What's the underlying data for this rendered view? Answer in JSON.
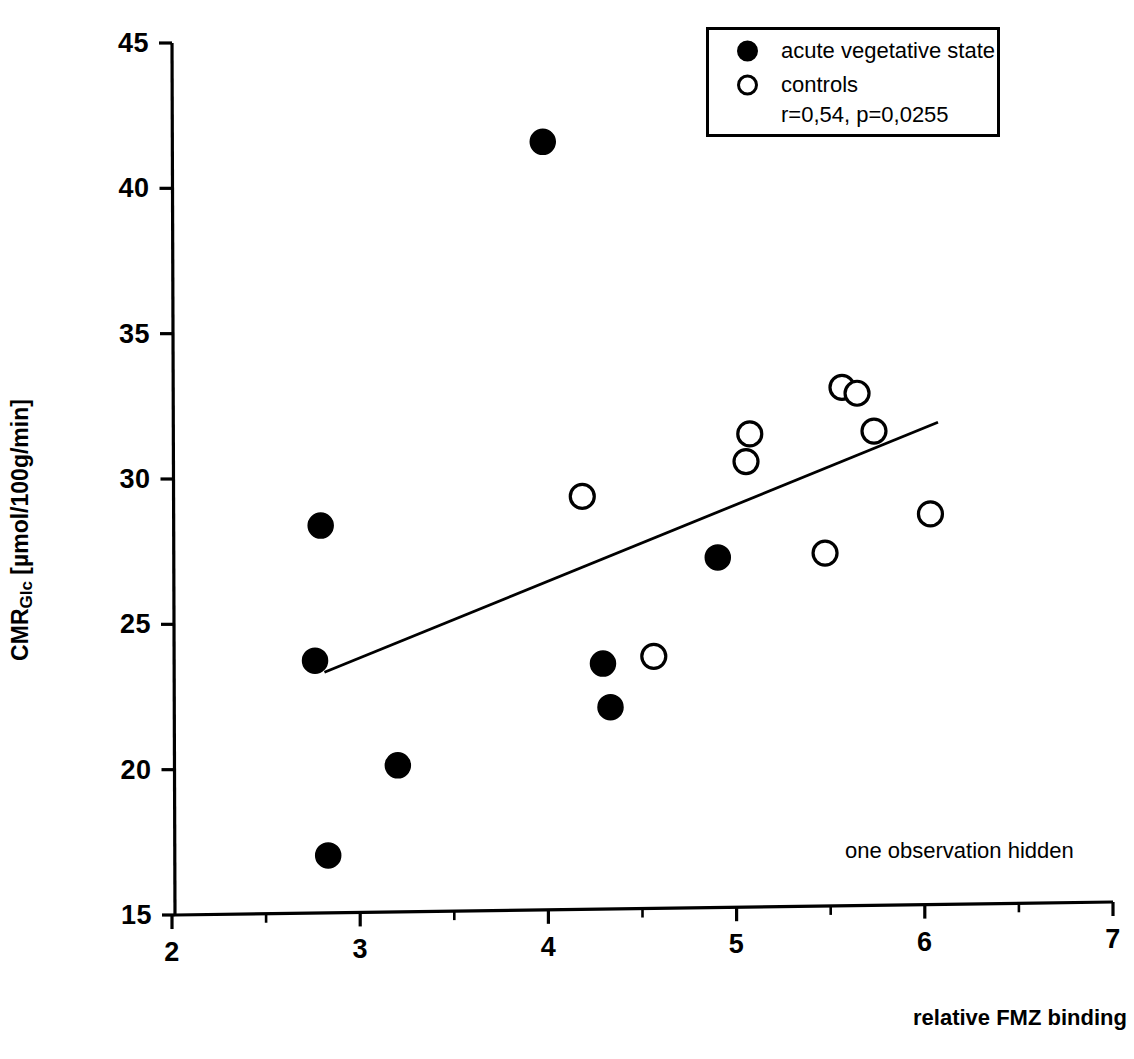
{
  "figure": {
    "background_color": "#ffffff",
    "foreground_color": "#000000"
  },
  "axes": {
    "y_title_main": "CMR",
    "y_title_sub": "Glc",
    "y_title_units": " [µmol/100g/min]",
    "x_title": "relative FMZ binding"
  },
  "legend": {
    "acute_marker": "filled-circle-marker",
    "acute_label": "acute vegetative state",
    "controls_marker": "open-circle-marker",
    "controls_label": "controls",
    "stats_label": "r=0,54, p=0,0255"
  },
  "annotation": {
    "hidden_note": "one observation hidden"
  },
  "chart_data": {
    "type": "scatter",
    "title": "",
    "xlabel": "relative FMZ binding",
    "ylabel": "CMRGlc [µmol/100g/min]",
    "xlim": [
      2,
      7
    ],
    "ylim": [
      15,
      45
    ],
    "xticks": [
      2,
      3,
      4,
      5,
      6,
      7
    ],
    "xtick_labels": [
      "2",
      "3",
      "4",
      "5",
      "6",
      "7"
    ],
    "x_minor_ticks": [
      2.5,
      3.5,
      4.5,
      5.5,
      6.5
    ],
    "yticks": [
      15,
      20,
      25,
      30,
      35,
      40,
      45
    ],
    "ytick_labels": [
      "15",
      "20",
      "25",
      "30",
      "35",
      "40",
      "45"
    ],
    "grid": false,
    "legend_position": "top-right",
    "correlation_r": 0.54,
    "p_value": 0.0255,
    "series": [
      {
        "name": "acute vegetative state",
        "marker": "filled-circle",
        "marker_color": "#000000",
        "points": [
          {
            "x": 2.79,
            "y": 28.4
          },
          {
            "x": 2.76,
            "y": 23.75
          },
          {
            "x": 2.83,
            "y": 17.05
          },
          {
            "x": 3.2,
            "y": 20.15
          },
          {
            "x": 3.97,
            "y": 41.6
          },
          {
            "x": 4.29,
            "y": 23.65
          },
          {
            "x": 4.33,
            "y": 22.15
          },
          {
            "x": 4.9,
            "y": 27.3
          }
        ]
      },
      {
        "name": "controls",
        "marker": "open-circle",
        "marker_color": "#ffffff",
        "marker_edge_color": "#000000",
        "points": [
          {
            "x": 4.18,
            "y": 29.4
          },
          {
            "x": 4.56,
            "y": 23.9
          },
          {
            "x": 5.07,
            "y": 31.55
          },
          {
            "x": 5.05,
            "y": 30.6
          },
          {
            "x": 5.47,
            "y": 27.45
          },
          {
            "x": 5.56,
            "y": 33.15
          },
          {
            "x": 5.64,
            "y": 32.95
          },
          {
            "x": 5.73,
            "y": 31.65
          },
          {
            "x": 6.03,
            "y": 28.8
          }
        ]
      }
    ],
    "regression_line": {
      "x_start": 2.81,
      "y_start": 23.35,
      "x_end": 6.07,
      "y_end": 31.95
    },
    "notes": [
      "one observation hidden"
    ]
  }
}
